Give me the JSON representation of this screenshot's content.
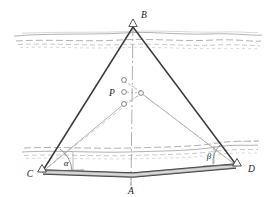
{
  "figure": {
    "type": "geometry-survey-diagram",
    "title": "",
    "background_color": "#ffffff",
    "width": 272,
    "height": 197,
    "labels": {
      "apex": "B",
      "base_left": "C",
      "base_right": "D",
      "base_center": "A",
      "interior_point": "P",
      "angle_left": "α",
      "angle_right": "β"
    },
    "points": {
      "B": {
        "x": 133,
        "y": 26,
        "label": "B",
        "label_x": 140,
        "label_y": 16,
        "marker": "triangle-station"
      },
      "C": {
        "x": 42,
        "y": 172,
        "label": "C",
        "label_x": 29,
        "label_y": 176,
        "marker": "triangle-station"
      },
      "D": {
        "x": 237,
        "y": 166,
        "label": "D",
        "label_x": 248,
        "label_y": 171,
        "marker": "triangle-station"
      },
      "A": {
        "x": 132,
        "y": 170,
        "label": "A",
        "label_x": 130,
        "label_y": 192,
        "marker": "none"
      },
      "P": {
        "x": 122,
        "y": 92,
        "label": "P",
        "label_x": 111,
        "label_y": 96,
        "marker": "circle-cluster"
      }
    },
    "p_cluster": [
      {
        "cx": 124,
        "cy": 80,
        "r": 2.3,
        "name": "node-upper"
      },
      {
        "cx": 124,
        "cy": 92,
        "r": 2.3,
        "name": "node-center"
      },
      {
        "cx": 124,
        "cy": 104,
        "r": 2.3,
        "name": "node-lower"
      },
      {
        "cx": 141,
        "cy": 93,
        "r": 2.3,
        "name": "node-right"
      }
    ],
    "edges": [
      {
        "name": "edge-B-C",
        "from": "B",
        "to": "C",
        "style": "solid-heavy"
      },
      {
        "name": "edge-B-D",
        "from": "B",
        "to": "D",
        "style": "solid-heavy"
      },
      {
        "name": "edge-C-D-baseline",
        "from": "C",
        "to": "D",
        "style": "double-heavy"
      },
      {
        "name": "axis-B-A",
        "from": "B",
        "to": "A",
        "style": "dash-dot"
      },
      {
        "name": "sight-C-P",
        "from": "C",
        "to": "P",
        "style": "dashed-light"
      },
      {
        "name": "sight-D-P",
        "from": "D",
        "to": "P",
        "style": "dashed-light"
      },
      {
        "name": "sight-C-Pright",
        "from": "C",
        "to": "node-right",
        "style": "dashed-light"
      },
      {
        "name": "sight-D-Pright",
        "from": "D",
        "to": "node-right",
        "style": "dashed-light"
      }
    ],
    "terrain_bands": [
      {
        "name": "terrain-band-upper",
        "y": 38,
        "description": "wavy contour lines crossing upper region"
      },
      {
        "name": "terrain-band-lower",
        "y": 148,
        "description": "wavy contour lines crossing lower region"
      }
    ],
    "colors": {
      "line_heavy": "#333333",
      "line_light": "#888888",
      "terrain": "#9a9a9a",
      "text": "#1a1a1a",
      "marker_fill": "#ffffff"
    }
  }
}
